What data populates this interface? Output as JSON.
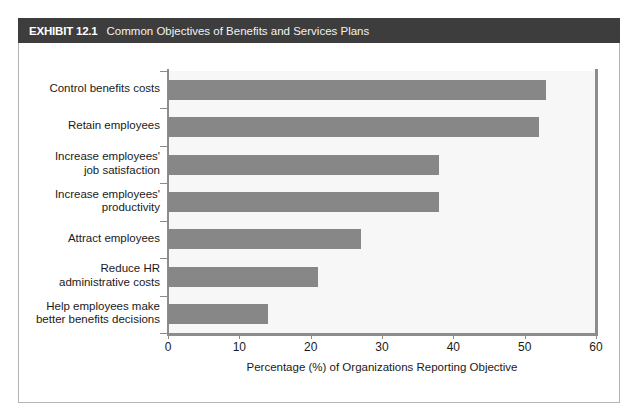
{
  "exhibit": {
    "tag": "EXHIBIT 12.1",
    "title": "Common Objectives of Benefits and Services Plans"
  },
  "colors": {
    "header_bar": "#3d3d3d",
    "bar_fill": "#878787",
    "axis": "#8c8c8c",
    "plot_background": "#f7f7f7",
    "text": "#1a1a1a"
  },
  "chart_data": {
    "type": "bar",
    "orientation": "horizontal",
    "title": "Common Objectives of Benefits and Services Plans",
    "categories": [
      "Control benefits costs",
      "Retain employees",
      "Increase employees' job satisfaction",
      "Increase employees' productivity",
      "Attract employees",
      "Reduce HR administrative costs",
      "Help employees make better benefits decisions"
    ],
    "category_lines": [
      [
        "Control benefits costs"
      ],
      [
        "Retain employees"
      ],
      [
        "Increase employees'",
        "job satisfaction"
      ],
      [
        "Increase employees'",
        "productivity"
      ],
      [
        "Attract employees"
      ],
      [
        "Reduce HR",
        "administrative costs"
      ],
      [
        "Help employees make",
        "better benefits decisions"
      ]
    ],
    "values": [
      53,
      52,
      38,
      38,
      27,
      21,
      14
    ],
    "xlabel": "Percentage (%) of Organizations Reporting Objective",
    "ylabel": "",
    "xlim": [
      0,
      60
    ],
    "xticks": [
      0,
      10,
      20,
      30,
      40,
      50,
      60
    ],
    "xtick_labels": [
      "0",
      "10",
      "20",
      "30",
      "40",
      "50",
      "60"
    ],
    "grid": false,
    "legend": null
  }
}
